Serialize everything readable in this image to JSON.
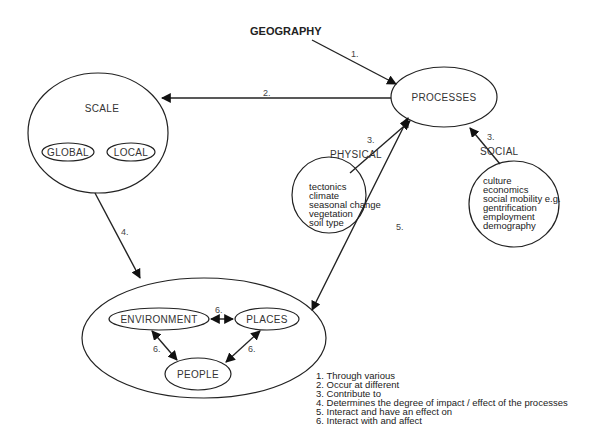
{
  "title": "GEOGRAPHY",
  "nodes": {
    "processes": "PROCESSES",
    "scale": "SCALE",
    "global": "GLOBAL",
    "local": "LOCAL",
    "physical": "PHYSICAL",
    "social": "SOCIAL",
    "environment": "ENVIRONMENT",
    "places": "PLACES",
    "people": "PEOPLE"
  },
  "physical_items": [
    "tectonics",
    "climate",
    "seasonal change",
    "vegetation",
    "soil type"
  ],
  "social_items": [
    "culture",
    "economics",
    "social mobility e.g.",
    "gentrification",
    "employment",
    "demography"
  ],
  "edge_labels": {
    "e1": "1.",
    "e2": "2.",
    "e3a": "3.",
    "e3b": "3.",
    "e4": "4.",
    "e5": "5.",
    "e6a": "6.",
    "e6b": "6.",
    "e6c": "6."
  },
  "legend": [
    "1. Through various",
    "2. Occur at different",
    "3. Contribute to",
    "4. Determines the degree of impact / effect of the processes",
    "5. Interact and have an effect on",
    "6. Interact with and affect"
  ]
}
